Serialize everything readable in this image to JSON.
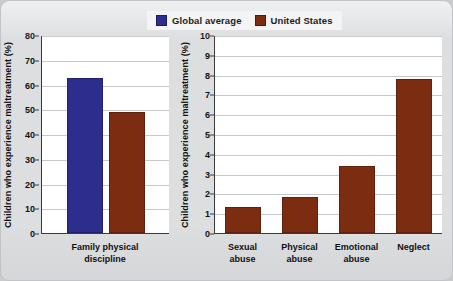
{
  "legend": {
    "items": [
      {
        "label": "Global average",
        "color": "#2d2d8e",
        "icon": "legend-swatch-blue"
      },
      {
        "label": "United States",
        "color": "#7c2c10",
        "icon": "legend-swatch-brown"
      }
    ]
  },
  "panels": {
    "left": {
      "ylabel": "Children who experience maltreatment (%)",
      "yticks": [
        "80",
        "70",
        "60",
        "50",
        "40",
        "30",
        "20",
        "10",
        "0"
      ],
      "categories": [
        "Family physical\ndiscipline"
      ]
    },
    "right": {
      "ylabel": "Children who experience maltreatment (%)",
      "yticks": [
        "10",
        "9",
        "8",
        "7",
        "6",
        "5",
        "4",
        "3",
        "2",
        "1",
        "0"
      ],
      "categories": [
        "Sexual\nabuse",
        "Physical\nabuse",
        "Emotional\nabuse",
        "Neglect"
      ]
    }
  },
  "chart_data": [
    {
      "type": "bar",
      "title": "",
      "panel": "left",
      "xlabel": "",
      "ylabel": "Children who experience maltreatment (%)",
      "ylim": [
        0,
        80
      ],
      "ytick_step": 10,
      "grid": true,
      "legend_position": "top-center",
      "categories": [
        "Family physical discipline"
      ],
      "series": [
        {
          "name": "Global average",
          "color": "#2d2d8e",
          "values": [
            62.5
          ]
        },
        {
          "name": "United States",
          "color": "#7c2c10",
          "values": [
            49.0
          ]
        }
      ]
    },
    {
      "type": "bar",
      "title": "",
      "panel": "right",
      "xlabel": "",
      "ylabel": "Children who experience maltreatment (%)",
      "ylim": [
        0,
        10
      ],
      "ytick_step": 1,
      "grid": true,
      "legend_position": "top-center",
      "categories": [
        "Sexual abuse",
        "Physical abuse",
        "Emotional abuse",
        "Neglect"
      ],
      "series": [
        {
          "name": "United States",
          "color": "#7c2c10",
          "values": [
            1.3,
            1.8,
            3.4,
            7.8
          ]
        }
      ]
    }
  ]
}
